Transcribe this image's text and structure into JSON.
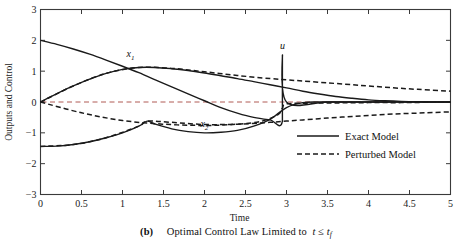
{
  "chart_data": {
    "type": "line",
    "title": "",
    "xlabel": "Time",
    "ylabel": "Outputs and Control",
    "xlim": [
      0,
      5
    ],
    "ylim": [
      -3,
      3
    ],
    "xticks": [
      "0",
      "0.5",
      "1",
      "1.5",
      "2",
      "2.5",
      "3",
      "3.5",
      "4",
      "4.5",
      "5"
    ],
    "xtick_values": [
      0,
      0.5,
      1,
      1.5,
      2,
      2.5,
      3,
      3.5,
      4,
      4.5,
      5
    ],
    "yticks": [
      "3",
      "2",
      "1",
      "0",
      "-1",
      "-2",
      "-3"
    ],
    "ytick_values": [
      3,
      2,
      1,
      0,
      -1,
      -2,
      -3
    ],
    "grid": false,
    "legend_position": "lower right",
    "zero_reference_line": {
      "y": 0,
      "style": "dashed",
      "color": "#b05a55"
    },
    "annotations": [
      {
        "text": "x",
        "sub": "1",
        "x": 1.05,
        "y": 1.45,
        "name": "curve-label-x1"
      },
      {
        "text": "x",
        "sub": "2",
        "x": 1.95,
        "y": -0.82,
        "name": "curve-label-x2"
      },
      {
        "text": "u",
        "sub": "",
        "x": 2.92,
        "y": 1.72,
        "name": "curve-label-u"
      }
    ],
    "series": [
      {
        "name": "x1 (Exact Model)",
        "style": "solid",
        "color": "#1a1a1a",
        "x": [
          0,
          0.2,
          0.4,
          0.6,
          0.8,
          1.0,
          1.2,
          1.4,
          1.6,
          1.8,
          2.0,
          2.2,
          2.4,
          2.6,
          2.8,
          3.0,
          3.2,
          3.4,
          3.6,
          3.8,
          4.0,
          4.2,
          4.4,
          4.6,
          4.8,
          5.0
        ],
        "y": [
          0.0,
          0.27,
          0.52,
          0.74,
          0.93,
          1.06,
          1.12,
          1.12,
          1.08,
          1.02,
          0.94,
          0.85,
          0.76,
          0.66,
          0.56,
          0.46,
          0.35,
          0.26,
          0.18,
          0.12,
          0.07,
          0.04,
          0.02,
          0.01,
          0.0,
          0.0
        ]
      },
      {
        "name": "x2 (Exact Model)",
        "style": "solid",
        "color": "#1a1a1a",
        "x": [
          0,
          0.2,
          0.4,
          0.6,
          0.8,
          1.0,
          1.2,
          1.3,
          1.4,
          1.6,
          1.8,
          2.0,
          2.2,
          2.4,
          2.6,
          2.8,
          3.0,
          3.2,
          3.4,
          3.6,
          3.8,
          4.0,
          4.5,
          5.0
        ],
        "y": [
          -1.44,
          -1.43,
          -1.38,
          -1.29,
          -1.16,
          -1.0,
          -0.78,
          -0.62,
          -0.72,
          -0.87,
          -0.96,
          -1.0,
          -0.98,
          -0.92,
          -0.78,
          -0.56,
          -0.18,
          -0.02,
          0.0,
          0.0,
          0.0,
          0.0,
          0.0,
          0.0
        ]
      },
      {
        "name": "u (Exact Model)",
        "style": "solid",
        "color": "#1a1a1a",
        "x": [
          0,
          0.2,
          0.4,
          0.6,
          0.8,
          1.0,
          1.2,
          1.4,
          1.6,
          1.8,
          2.0,
          2.2,
          2.4,
          2.6,
          2.8,
          2.95,
          2.95,
          3.0,
          3.5,
          4.0,
          4.5,
          5.0
        ],
        "y": [
          2.0,
          1.87,
          1.72,
          1.55,
          1.36,
          1.16,
          0.95,
          0.72,
          0.49,
          0.26,
          0.04,
          -0.18,
          -0.36,
          -0.5,
          -0.58,
          -0.62,
          1.52,
          0.0,
          0.0,
          0.0,
          0.0,
          0.0
        ]
      },
      {
        "name": "x1 (Perturbed Model)",
        "style": "dashed",
        "color": "#1a1a1a",
        "x": [
          0,
          0.4,
          0.8,
          1.2,
          1.6,
          2.0,
          2.4,
          2.8,
          3.0,
          3.2,
          3.5,
          3.8,
          4.0,
          4.3,
          4.6,
          5.0
        ],
        "y": [
          0.0,
          0.52,
          0.93,
          1.12,
          1.09,
          0.98,
          0.86,
          0.76,
          0.72,
          0.68,
          0.62,
          0.56,
          0.52,
          0.46,
          0.41,
          0.35
        ]
      },
      {
        "name": "x2 (Perturbed Model)",
        "style": "dashed",
        "color": "#1a1a1a",
        "x": [
          0,
          0.4,
          0.8,
          1.2,
          1.3,
          1.6,
          2.0,
          2.4,
          2.8,
          3.0,
          3.2,
          3.5,
          3.8,
          4.1,
          4.4,
          4.7,
          5.0
        ],
        "y": [
          -1.44,
          -1.38,
          -1.16,
          -0.78,
          -0.62,
          -0.66,
          -0.73,
          -0.72,
          -0.66,
          -0.62,
          -0.58,
          -0.52,
          -0.47,
          -0.42,
          -0.38,
          -0.35,
          -0.32
        ]
      },
      {
        "name": "u (Perturbed Model)",
        "style": "dashed",
        "color": "#1a1a1a",
        "x": [
          0,
          0.5,
          1.0,
          1.5,
          2.0,
          2.4,
          2.7,
          2.9,
          2.95,
          3.0,
          3.3,
          3.6,
          4.0,
          4.4,
          4.7,
          5.0
        ],
        "y": [
          0.0,
          -0.35,
          -0.6,
          -0.72,
          -0.76,
          -0.72,
          -0.62,
          -0.4,
          -0.2,
          -0.06,
          -0.04,
          -0.03,
          -0.02,
          -0.02,
          -0.01,
          -0.01
        ]
      }
    ]
  },
  "legend": {
    "entries": [
      {
        "label": "Exact Model",
        "style": "solid"
      },
      {
        "label": "Perturbed Model",
        "style": "dashed"
      }
    ]
  },
  "caption": {
    "tag": "(b)",
    "text": "Optimal Control Law Limited to",
    "variable": "t",
    "relation": "≤",
    "variable2": "t",
    "variable2_sub": "f"
  }
}
